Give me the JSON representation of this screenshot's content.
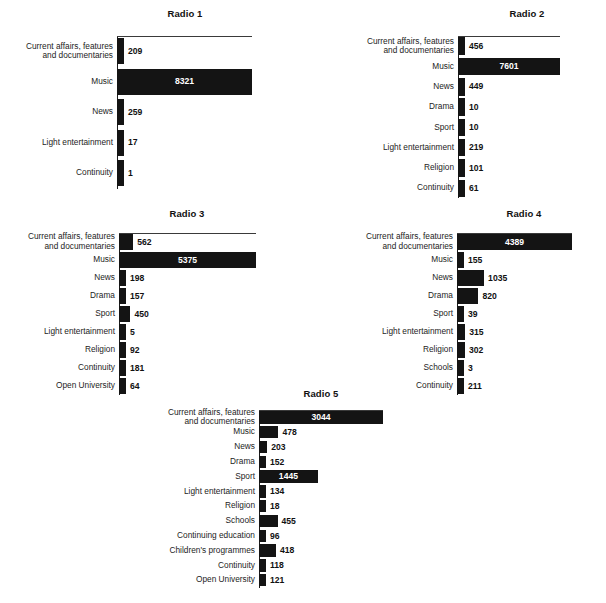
{
  "figure": {
    "background": "#ffffff",
    "bar_color": "#141414",
    "inside_label_color": "#ffffff",
    "outside_label_color": "#111111"
  },
  "chart_data": [
    {
      "type": "bar",
      "orientation": "horizontal",
      "title": "Radio 1",
      "xlabel": "",
      "ylabel": "",
      "grid": false,
      "legend": "none",
      "xlim": [
        0,
        8321
      ],
      "categories": [
        "Current affairs, features\nand documentaries",
        "Music",
        "News",
        "Light entertainment",
        "Continuity"
      ],
      "values": [
        209,
        8321,
        259,
        17,
        1
      ],
      "value_labels": [
        "209",
        "8321",
        "259",
        "17",
        "1"
      ]
    },
    {
      "type": "bar",
      "orientation": "horizontal",
      "title": "Radio 2",
      "xlabel": "",
      "ylabel": "",
      "grid": false,
      "legend": "none",
      "xlim": [
        0,
        7601
      ],
      "categories": [
        "Current affairs, features\nand documentaries",
        "Music",
        "News",
        "Drama",
        "Sport",
        "Light entertainment",
        "Religion",
        "Continuity"
      ],
      "values": [
        456,
        7601,
        449,
        10,
        10,
        219,
        101,
        61
      ],
      "value_labels": [
        "456",
        "7601",
        "449",
        "10",
        "10",
        "219",
        "101",
        "61"
      ]
    },
    {
      "type": "bar",
      "orientation": "horizontal",
      "title": "Radio 3",
      "xlabel": "",
      "ylabel": "",
      "grid": false,
      "legend": "none",
      "xlim": [
        0,
        5375
      ],
      "categories": [
        "Current affairs, features\nand documentaries",
        "Music",
        "News",
        "Drama",
        "Sport",
        "Light entertainment",
        "Religion",
        "Continuity",
        "Open University"
      ],
      "values": [
        562,
        5375,
        198,
        157,
        450,
        5,
        92,
        181,
        64
      ],
      "value_labels": [
        "562",
        "5375",
        "198",
        "157",
        "450",
        "5",
        "92",
        "181",
        "64"
      ]
    },
    {
      "type": "bar",
      "orientation": "horizontal",
      "title": "Radio 4",
      "xlabel": "",
      "ylabel": "",
      "grid": false,
      "legend": "none",
      "xlim": [
        0,
        4389
      ],
      "categories": [
        "Current affairs, features\nand documentaries",
        "Music",
        "News",
        "Drama",
        "Sport",
        "Light entertainment",
        "Religion",
        "Schools",
        "Continuity"
      ],
      "values": [
        4389,
        155,
        1035,
        820,
        39,
        315,
        302,
        3,
        211
      ],
      "value_labels": [
        "4389",
        "155",
        "1035",
        "820",
        "39",
        "315",
        "302",
        "3",
        "211"
      ]
    },
    {
      "type": "bar",
      "orientation": "horizontal",
      "title": "Radio 5",
      "xlabel": "",
      "ylabel": "",
      "grid": false,
      "legend": "none",
      "xlim": [
        0,
        3044
      ],
      "categories": [
        "Current affairs, features\nand documentaries",
        "Music",
        "News",
        "Drama",
        "Sport",
        "Light entertainment",
        "Religion",
        "Schools",
        "Continuing education",
        "Children's programmes",
        "Continuity",
        "Open University"
      ],
      "values": [
        3044,
        478,
        203,
        152,
        1445,
        134,
        18,
        455,
        96,
        418,
        118,
        121
      ],
      "value_labels": [
        "3044",
        "478",
        "203",
        "152",
        "1445",
        "134",
        "18",
        "455",
        "96",
        "418",
        "118",
        "121"
      ]
    }
  ],
  "layout": [
    {
      "left": 0,
      "top": 8,
      "axis_x": 117,
      "axis_y": 36,
      "plot_w": 135,
      "row_h": 30.5,
      "bar_h": 26,
      "title_cx": 185,
      "label_w": 112
    },
    {
      "left": 303,
      "top": 8,
      "axis_x": 458,
      "axis_y": 36,
      "plot_w": 102,
      "row_h": 20.3,
      "bar_h": 17.5,
      "title_cx": 527,
      "label_w": 112
    },
    {
      "left": 0,
      "top": 208,
      "axis_x": 119,
      "axis_y": 233,
      "plot_w": 137,
      "row_h": 18.0,
      "bar_h": 15.5,
      "title_cx": 187,
      "label_w": 114
    },
    {
      "left": 303,
      "top": 208,
      "axis_x": 457,
      "axis_y": 233,
      "plot_w": 115,
      "row_h": 18.0,
      "bar_h": 15.5,
      "title_cx": 524,
      "label_w": 112
    },
    {
      "left": 140,
      "top": 388,
      "axis_x": 259,
      "axis_y": 410,
      "plot_w": 124,
      "row_h": 14.8,
      "bar_h": 12.6,
      "title_cx": 321,
      "label_w": 114
    }
  ]
}
